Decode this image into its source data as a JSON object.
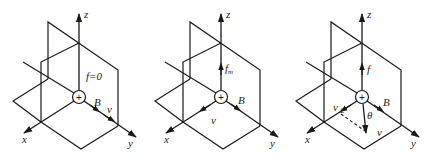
{
  "figure": {
    "panels": [
      {
        "id": "panel-1",
        "offset_x": 0,
        "axes": {
          "x": "x",
          "y": "y",
          "z": "z"
        },
        "charge": "+",
        "force_label": "f=0",
        "field_label": "B",
        "velocity_label": "v",
        "description": "velocity parallel to B along y-axis, force is zero"
      },
      {
        "id": "panel-2",
        "offset_x": 142,
        "axes": {
          "x": "x",
          "y": "y",
          "z": "z"
        },
        "charge": "+",
        "force_label": "f",
        "force_subscript": "m",
        "field_label": "B",
        "velocity_label": "v",
        "description": "velocity along x-axis perpendicular to B, force f_m along z"
      },
      {
        "id": "panel-3",
        "offset_x": 283,
        "axes": {
          "x": "x",
          "y": "y",
          "z": "z"
        },
        "charge": "+",
        "force_label": "f",
        "field_label": "B",
        "velocity_label": "v",
        "perp_velocity_label": "v",
        "perp_velocity_subscript": "⊥",
        "angle_label": "θ",
        "description": "velocity at angle θ to B, perpendicular component v⊥ along x, force f along z"
      }
    ],
    "colors": {
      "ink": "#1a1a1a",
      "background": "#ffffff"
    }
  }
}
